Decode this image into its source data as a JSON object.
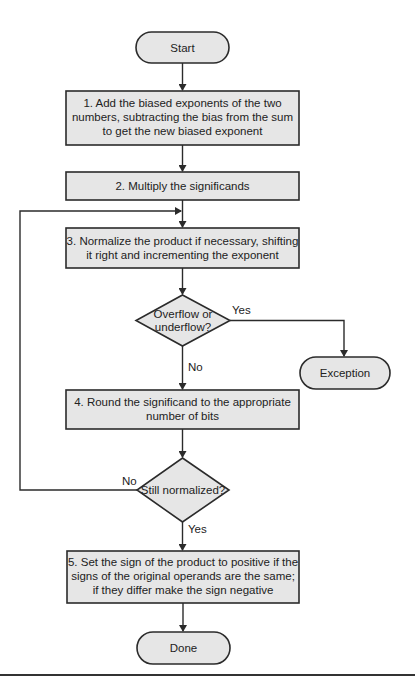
{
  "diagram": {
    "type": "flowchart",
    "nodes": {
      "start": {
        "label": "Start"
      },
      "step1": {
        "lines": [
          "1. Add the biased exponents of the two",
          "numbers, subtracting the bias from the sum",
          "to get the new biased exponent"
        ]
      },
      "step2": {
        "lines": [
          "2. Multiply the significands"
        ]
      },
      "step3": {
        "lines": [
          "3. Normalize the product if necessary, shifting",
          "it right and incrementing the exponent"
        ]
      },
      "decision1": {
        "lines": [
          "Overflow or",
          "underflow?"
        ]
      },
      "exception": {
        "label": "Exception"
      },
      "step4": {
        "lines": [
          "4. Round the significand to the appropriate",
          "number of bits"
        ]
      },
      "decision2": {
        "lines": [
          "Still normalized?"
        ]
      },
      "step5": {
        "lines": [
          "5. Set the sign of the product to positive if the",
          "signs of the original operands are the same;",
          "if they differ make the sign negative"
        ]
      },
      "done": {
        "label": "Done"
      }
    },
    "edges": {
      "d1_yes": "Yes",
      "d1_no": "No",
      "d2_no": "No",
      "d2_yes": "Yes"
    },
    "colors": {
      "fill": "#e6e6e6",
      "stroke": "#2b2b2b",
      "text": "#222222",
      "background": "#ffffff"
    }
  }
}
